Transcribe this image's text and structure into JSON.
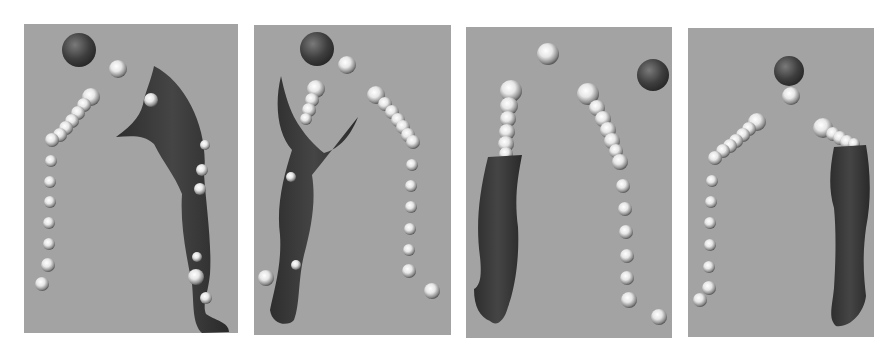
{
  "figure": {
    "background": "#ffffff",
    "panel_background": "#a3a3a3",
    "leg_color": "#3a3a3a",
    "head_color": "#4a4a4a",
    "marker_color": "#e8e8e8",
    "panels": [
      {
        "id": 1,
        "label": "view-1",
        "x": 24,
        "y": 24,
        "w": 214,
        "h": 309
      },
      {
        "id": 2,
        "label": "view-2",
        "x": 254,
        "y": 25,
        "w": 197,
        "h": 310
      },
      {
        "id": 3,
        "label": "view-3",
        "x": 466,
        "y": 27,
        "w": 206,
        "h": 311
      },
      {
        "id": 4,
        "label": "view-4",
        "x": 688,
        "y": 28,
        "w": 186,
        "h": 309
      }
    ]
  }
}
